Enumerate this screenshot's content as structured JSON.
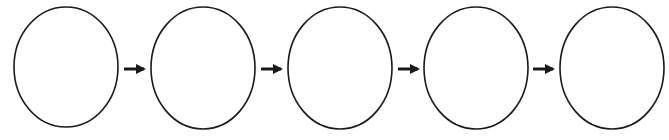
{
  "diagram": {
    "type": "flow-sequence",
    "side_text": "",
    "stroke_color": "#1a1a1a",
    "fill_color": "#ffffff",
    "nodes": [
      {
        "id": "stage-1",
        "cx": 66,
        "cy": 67,
        "rx": 52,
        "ry": 60,
        "label": ""
      },
      {
        "id": "stage-2",
        "cx": 203,
        "cy": 68,
        "rx": 52,
        "ry": 61,
        "label": ""
      },
      {
        "id": "stage-3",
        "cx": 340,
        "cy": 68,
        "rx": 52,
        "ry": 61,
        "label": ""
      },
      {
        "id": "stage-4",
        "cx": 476,
        "cy": 68,
        "rx": 52,
        "ry": 61,
        "label": ""
      },
      {
        "id": "stage-5",
        "cx": 612,
        "cy": 68,
        "rx": 52,
        "ry": 61,
        "label": ""
      }
    ],
    "arrows": [
      {
        "from": "stage-1",
        "to": "stage-2",
        "x1": 124,
        "x2": 146,
        "y": 69
      },
      {
        "from": "stage-2",
        "to": "stage-3",
        "x1": 261,
        "x2": 283,
        "y": 69
      },
      {
        "from": "stage-3",
        "to": "stage-4",
        "x1": 398,
        "x2": 420,
        "y": 69
      },
      {
        "from": "stage-4",
        "to": "stage-5",
        "x1": 533,
        "x2": 555,
        "y": 69
      }
    ]
  }
}
